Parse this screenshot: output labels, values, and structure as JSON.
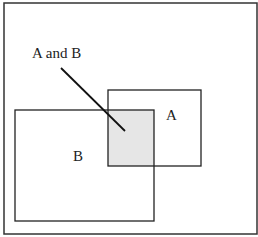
{
  "diagram": {
    "type": "venn-rectangles",
    "frame": {
      "x": 4,
      "y": 3,
      "w": 253,
      "h": 231
    },
    "set_a": {
      "label": "A",
      "x": 108,
      "y": 90,
      "w": 93,
      "h": 76
    },
    "set_b": {
      "label": "B",
      "x": 15,
      "y": 110,
      "w": 139,
      "h": 111
    },
    "intersection": {
      "label": "A and B",
      "x": 108,
      "y": 110,
      "w": 46,
      "h": 56,
      "fill": "#e6e6e6"
    },
    "pointer": {
      "x1": 61,
      "y1": 68,
      "x2": 125,
      "y2": 131
    },
    "stroke_color": "#222222"
  }
}
